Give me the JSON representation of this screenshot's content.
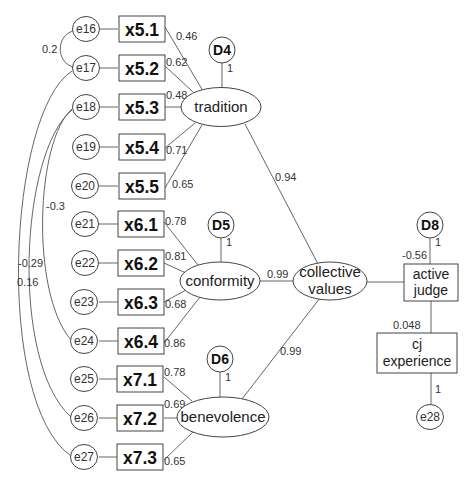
{
  "diagram": {
    "observed": [
      {
        "label": "x5.1",
        "error": "e16",
        "loading": "0.46"
      },
      {
        "label": "x5.2",
        "error": "e17",
        "loading": "0.62"
      },
      {
        "label": "x5.3",
        "error": "e18",
        "loading": "0.48"
      },
      {
        "label": "x5.4",
        "error": "e19",
        "loading": "0.71"
      },
      {
        "label": "x5.5",
        "error": "e20",
        "loading": "0.65"
      },
      {
        "label": "x6.1",
        "error": "e21",
        "loading": "0.78"
      },
      {
        "label": "x6.2",
        "error": "e22",
        "loading": "0.81"
      },
      {
        "label": "x6.3",
        "error": "e23",
        "loading": "0.68"
      },
      {
        "label": "x6.4",
        "error": "e24",
        "loading": "0.86"
      },
      {
        "label": "x7.1",
        "error": "e25",
        "loading": "0.78"
      },
      {
        "label": "x7.2",
        "error": "e26",
        "loading": "0.69"
      },
      {
        "label": "x7.3",
        "error": "e27",
        "loading": "0.65"
      }
    ],
    "latent": {
      "tradition": "tradition",
      "conformity": "conformity",
      "benevolence": "benevolence",
      "collective_line1": "collective",
      "collective_line2": "values"
    },
    "disturbances": {
      "d4": {
        "label": "D4",
        "weight": "1"
      },
      "d5": {
        "label": "D5",
        "weight": "1"
      },
      "d6": {
        "label": "D6",
        "weight": "1"
      },
      "d8": {
        "label": "D8",
        "weight": "1"
      }
    },
    "outcomes": {
      "active_judge_line1": "active",
      "active_judge_line2": "judge",
      "cj_experience_line1": "cj",
      "cj_experience_line2": "experience"
    },
    "e28": {
      "label": "e28",
      "weight": "1"
    },
    "structural_paths": {
      "tradition_to_collective": "0.94",
      "conformity_to_collective": "0.99",
      "benevolence_to_collective": "0.99",
      "collective_to_active_judge": "-0.56",
      "active_judge_to_cj_experience": "0.048"
    },
    "covariances": [
      {
        "from": "e16",
        "to": "e17",
        "value": "0.2"
      },
      {
        "from": "e18",
        "to": "e24",
        "value": "-0.3"
      },
      {
        "from": "e18",
        "to": "e26",
        "value": "-0.29"
      },
      {
        "from": "e17",
        "to": "e27",
        "value": "0.16"
      }
    ]
  }
}
